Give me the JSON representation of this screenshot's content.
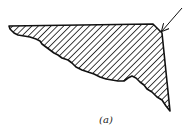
{
  "figure": {
    "caption": "(a)",
    "colors": {
      "outline": "#111111",
      "hatch": "#111111",
      "background": "#ffffff"
    }
  }
}
